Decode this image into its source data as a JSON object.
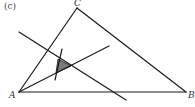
{
  "figure": {
    "tag": "(c)",
    "vertices": {
      "A": {
        "label": "A",
        "x": 19,
        "y": 92
      },
      "B": {
        "label": "B",
        "x": 186,
        "y": 92
      },
      "C": {
        "label": "C",
        "x": 77,
        "y": 8
      }
    },
    "lines": [
      {
        "name": "line-1",
        "x1": 19,
        "y1": 32,
        "x2": 126,
        "y2": 100
      },
      {
        "name": "line-2",
        "x1": 19,
        "y1": 92,
        "x2": 109,
        "y2": 46
      },
      {
        "name": "line-3",
        "x1": 62,
        "y1": 49,
        "x2": 55,
        "y2": 80
      }
    ],
    "shaded_region": {
      "points": "58,59 71,66 56,73",
      "color": "#7a7a7a"
    },
    "colors": {
      "stroke": "#1a1a1a",
      "background": "#ffffff"
    }
  }
}
